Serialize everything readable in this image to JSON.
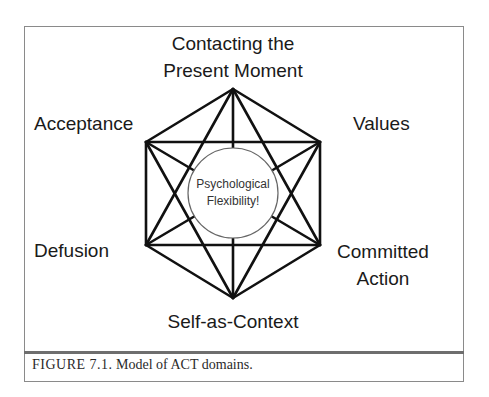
{
  "figure": {
    "labels": {
      "top_line1": "Contacting the",
      "top_line2": "Present Moment",
      "upper_left": "Acceptance",
      "upper_right": "Values",
      "lower_left": "Defusion",
      "lower_right_line1": "Committed",
      "lower_right_line2": "Action",
      "bottom": "Self-as-Context"
    },
    "center": {
      "line1": "Psychological",
      "line2": "Flexibility!"
    },
    "caption": {
      "number": "FIGURE 7.1.",
      "text": "Model of ACT domains."
    },
    "nodes": [
      {
        "id": "present-moment",
        "x": 233,
        "y": 89
      },
      {
        "id": "values",
        "x": 320,
        "y": 142
      },
      {
        "id": "committed-action",
        "x": 320,
        "y": 245
      },
      {
        "id": "self-as-context",
        "x": 233,
        "y": 298
      },
      {
        "id": "defusion",
        "x": 146,
        "y": 245
      },
      {
        "id": "acceptance",
        "x": 146,
        "y": 142
      }
    ],
    "colors": {
      "line": "#111111",
      "frame": "#8a8a8a",
      "circle_stroke": "#666666"
    }
  }
}
